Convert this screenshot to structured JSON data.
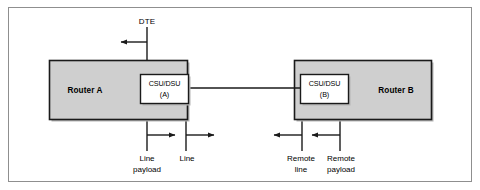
{
  "figure": {
    "border_color": "#8c8c8c",
    "background": "#ffffff",
    "line_color": "#1a1a1a",
    "router_fill": "#cfcfcf",
    "router_stroke": "#1a1a1a",
    "csu_fill": "#ffffff",
    "csu_stroke": "#1a1a1a",
    "shadow_color": "#b5b5b5"
  },
  "nodes": {
    "router_a": {
      "label": "Router A"
    },
    "router_b": {
      "label": "Router B"
    },
    "csu_dsu_a": {
      "line1": "CSU/DSU",
      "line2": "(A)"
    },
    "csu_dsu_b": {
      "line1": "CSU/DSU",
      "line2": "(B)"
    }
  },
  "annotations": {
    "dte": {
      "label": "DTE"
    },
    "line_payload": {
      "line1": "Line",
      "line2": "payload"
    },
    "line": {
      "line1": "Line",
      "line2": ""
    },
    "remote_line": {
      "line1": "Remote",
      "line2": "line"
    },
    "remote_payload": {
      "line1": "Remote",
      "line2": "payload"
    }
  },
  "icons": {
    "arrow_left": "arrow-left-icon",
    "arrow_right": "arrow-right-icon",
    "arrow_up": "arrow-up-icon",
    "arrow_down": "arrow-down-icon",
    "link_line": "connection-line-icon"
  }
}
